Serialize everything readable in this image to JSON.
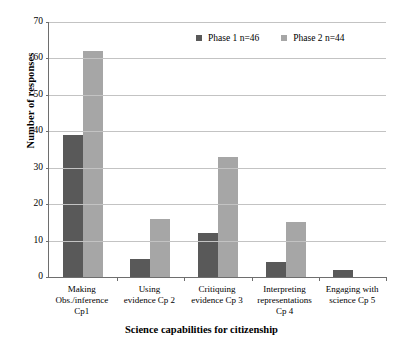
{
  "chart_data": {
    "type": "bar",
    "title": "",
    "xlabel": "Science capabilities for citizenship",
    "ylabel": "Number of responses",
    "ylim": [
      0,
      70
    ],
    "ytick_step": 10,
    "yticks": [
      0,
      10,
      20,
      30,
      40,
      50,
      60,
      70
    ],
    "grid": true,
    "legend_position": "top-right",
    "categories": [
      "Making\nObs./inference\nCp1",
      "Using\nevidence Cp 2",
      "Critiquing\nevidence Cp 3",
      "Interpreting\nrepresentations\nCp 4",
      "Engaging with\nscience Cp 5"
    ],
    "series": [
      {
        "name": "Phase 1  n=46",
        "color": "#595959",
        "values": [
          39,
          5,
          12,
          4,
          2
        ]
      },
      {
        "name": "Phase 2 n=44",
        "color": "#a6a6a6",
        "values": [
          62,
          16,
          33,
          15,
          0
        ]
      }
    ]
  },
  "axis": {
    "y_title": "Number of responses",
    "x_title": "Science capabilities for citizenship",
    "y_tick_labels": [
      "70",
      "60",
      "50",
      "40",
      "30",
      "20",
      "10",
      "0"
    ]
  },
  "legend": {
    "entries": [
      {
        "label": "Phase 1  n=46",
        "color": "#595959"
      },
      {
        "label": "Phase 2 n=44",
        "color": "#a6a6a6"
      }
    ]
  },
  "colors": {
    "series_1": "#595959",
    "series_2": "#a6a6a6",
    "gridline": "#c3c3c3",
    "axis": "#6e6e6e",
    "background": "#ffffff"
  }
}
